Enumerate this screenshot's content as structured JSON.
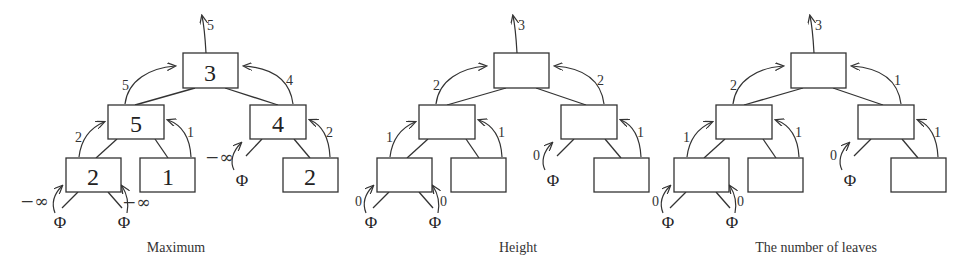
{
  "figure": {
    "panels": [
      {
        "caption": "Maximum",
        "root_value": "3",
        "root_out": "5",
        "left_value": "5",
        "left_out": "5",
        "right_value": "4",
        "right_out": "4",
        "ll_value": "2",
        "ll_out": "2",
        "lr_value": "1",
        "lr_out": "1",
        "rr_value": "2",
        "rr_out": "2",
        "ll_left_null": "−∞",
        "ll_right_null": "−∞",
        "right_left_null": "−∞",
        "null_symbol": "Φ"
      },
      {
        "caption": "Height",
        "root_value": "",
        "root_out": "3",
        "left_value": "",
        "left_out": "2",
        "right_value": "",
        "right_out": "2",
        "ll_value": "",
        "ll_out": "1",
        "lr_value": "",
        "lr_out": "1",
        "rr_value": "",
        "rr_out": "1",
        "ll_left_null": "0",
        "ll_right_null": "0",
        "right_left_null": "0",
        "null_symbol": "Φ"
      },
      {
        "caption": "The number of leaves",
        "root_value": "",
        "root_out": "3",
        "left_value": "",
        "left_out": "2",
        "right_value": "",
        "right_out": "1",
        "ll_value": "",
        "ll_out": "1",
        "lr_value": "",
        "lr_out": "1",
        "rr_value": "",
        "rr_out": "1",
        "ll_left_null": "0",
        "ll_right_null": "0",
        "right_left_null": "0",
        "null_symbol": "Φ"
      }
    ]
  }
}
